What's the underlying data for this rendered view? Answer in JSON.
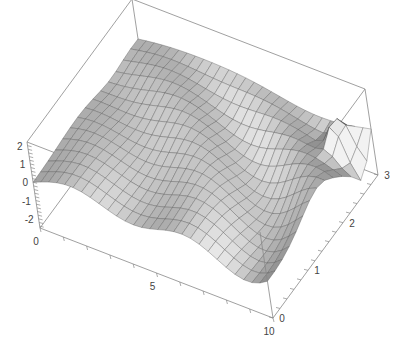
{
  "chart_data": {
    "type": "surface3d",
    "title": "",
    "xlabel": "",
    "ylabel": "",
    "zlabel": "",
    "x_range": [
      0,
      10
    ],
    "y_range": [
      0,
      3
    ],
    "z_range": [
      -2.5,
      2.2
    ],
    "x_ticks": [
      {
        "value": 0,
        "label": "0"
      },
      {
        "value": 5,
        "label": "5"
      },
      {
        "value": 10,
        "label": "10"
      }
    ],
    "y_ticks": [
      {
        "value": 0,
        "label": "0"
      },
      {
        "value": 1,
        "label": "1"
      },
      {
        "value": 2,
        "label": "2"
      },
      {
        "value": 3,
        "label": "3"
      }
    ],
    "z_ticks": [
      {
        "value": 2,
        "label": "2"
      },
      {
        "value": 1,
        "label": "1"
      },
      {
        "value": 0,
        "label": "0"
      },
      {
        "value": -1,
        "label": "-1"
      },
      {
        "value": -2,
        "label": "-2"
      }
    ],
    "mesh": {
      "x_lines": 28,
      "y_lines": 14
    },
    "surface_description": "Wavy surface z(x,y): near-flat ridges along y at small x, growing oscillation amplitude with x and y; deep trough and sharp peak near x=10, y=3",
    "grid": false,
    "legend": null,
    "box": true,
    "colors": {
      "surface_light": "#e4e4e4",
      "surface_dark": "#5a5a5a",
      "mesh_line": "#555555",
      "box_line": "#888888",
      "axis_label": "#444444"
    }
  }
}
